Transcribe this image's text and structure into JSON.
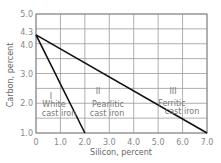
{
  "chart_data": {
    "type": "line",
    "title": "",
    "xlabel": "Silicon, percent",
    "ylabel": "Carbon, percent",
    "xlim": [
      0,
      7.0
    ],
    "ylim": [
      1.0,
      5.0
    ],
    "x_ticks": [
      "0",
      "1.0",
      "2.0",
      "3.0",
      "4.0",
      "5.0",
      "6.0",
      "7.0"
    ],
    "x_tick_values": [
      0,
      1,
      2,
      3,
      4,
      5,
      6,
      7
    ],
    "y_ticks": [
      "1.0",
      "2.0",
      "3.0",
      "4.0",
      "4.3",
      "5.0"
    ],
    "y_tick_values": [
      1.0,
      2.0,
      3.0,
      4.0,
      4.3,
      5.0
    ],
    "y_grid_values": [
      1.0,
      1.5,
      2.0,
      2.5,
      3.0,
      3.5,
      4.0,
      4.5,
      5.0
    ],
    "grid": true,
    "series": [
      {
        "name": "White / Pearlitic boundary",
        "x": [
          0,
          2.0
        ],
        "y": [
          4.3,
          1.0
        ]
      },
      {
        "name": "Pearlitic / Ferritic boundary",
        "x": [
          0,
          7.0
        ],
        "y": [
          4.3,
          1.0
        ]
      }
    ],
    "regions": [
      {
        "numeral": "I",
        "line1": "White",
        "line2": "cast iron"
      },
      {
        "numeral": "II",
        "line1": "Pearlitic",
        "line2": "cast iron"
      },
      {
        "numeral": "III",
        "line1": "Ferritic",
        "line2": "cast iron"
      }
    ]
  }
}
